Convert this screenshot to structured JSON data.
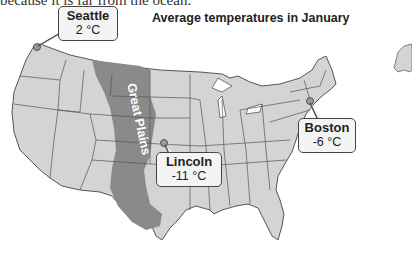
{
  "caption": {
    "text": "because it is far from the ocean."
  },
  "title": "Average temperatures in January",
  "map": {
    "region": "United States (contiguous)",
    "highlight_region": {
      "label": "Great Plains",
      "color": "#8a8a8a"
    },
    "land_color": "#d4d4d4",
    "border_color": "#555555"
  },
  "cities": [
    {
      "name": "Seattle",
      "temp": "2 °C",
      "marker": "city-dot"
    },
    {
      "name": "Lincoln",
      "temp": "-11 °C",
      "marker": "city-dot"
    },
    {
      "name": "Boston",
      "temp": "-6 °C",
      "marker": "city-dot"
    }
  ]
}
